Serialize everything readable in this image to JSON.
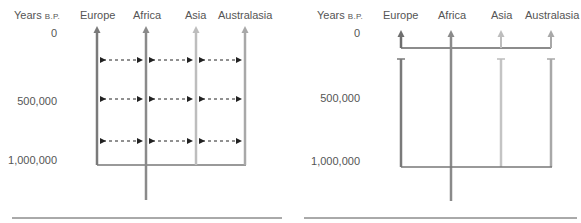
{
  "figure": {
    "left_panel": {
      "model": "multiregional continuity (gene flow among regions)",
      "y_axis_title": "Years",
      "y_axis_title_suffix": "B.P.",
      "y_ticks": [
        "0",
        "500,000",
        "1,000,000"
      ],
      "regions": [
        "Europe",
        "Africa",
        "Asia",
        "Australasia"
      ],
      "gene_flow_rows": 3
    },
    "right_panel": {
      "model": "out of Africa (replacement)",
      "y_axis_title": "Years",
      "y_axis_title_suffix": "B.P.",
      "y_ticks": [
        "0",
        "500,000",
        "1,000,000"
      ],
      "regions": [
        "Europe",
        "Africa",
        "Asia",
        "Australasia"
      ]
    },
    "colors": {
      "europe": "#7a7a7a",
      "africa": "#8a8a8a",
      "asia": "#bdbdbd",
      "australasia": "#a8a8a8",
      "arrow_dash": "#222222",
      "rule": "#555555"
    }
  }
}
